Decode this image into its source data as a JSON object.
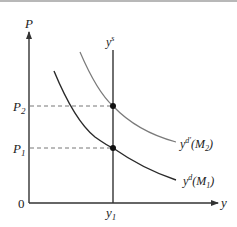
{
  "diagram": {
    "type": "economics-supply-demand",
    "axes": {
      "y_label": "P",
      "x_label": "y",
      "origin_label": "0"
    },
    "price_levels": [
      {
        "label": "P",
        "sub": "2"
      },
      {
        "label": "P",
        "sub": "1"
      }
    ],
    "output_level": {
      "label": "y",
      "sub": "1"
    },
    "supply_curve": {
      "label": "y",
      "sup": "s"
    },
    "demand_curves": [
      {
        "label": "y",
        "sup": "d′",
        "arg": "(M",
        "arg_sub": "2",
        "arg_close": ")",
        "shade": "light"
      },
      {
        "label": "y",
        "sup": "d",
        "arg": "(M",
        "arg_sub": "1",
        "arg_close": ")",
        "shade": "dark"
      }
    ],
    "colors": {
      "axis": "#333333",
      "supply": "#333333",
      "demand_new": "#7a7a7a",
      "demand_old": "#2a2a2a",
      "guide": "#666666",
      "point": "#111111"
    }
  }
}
